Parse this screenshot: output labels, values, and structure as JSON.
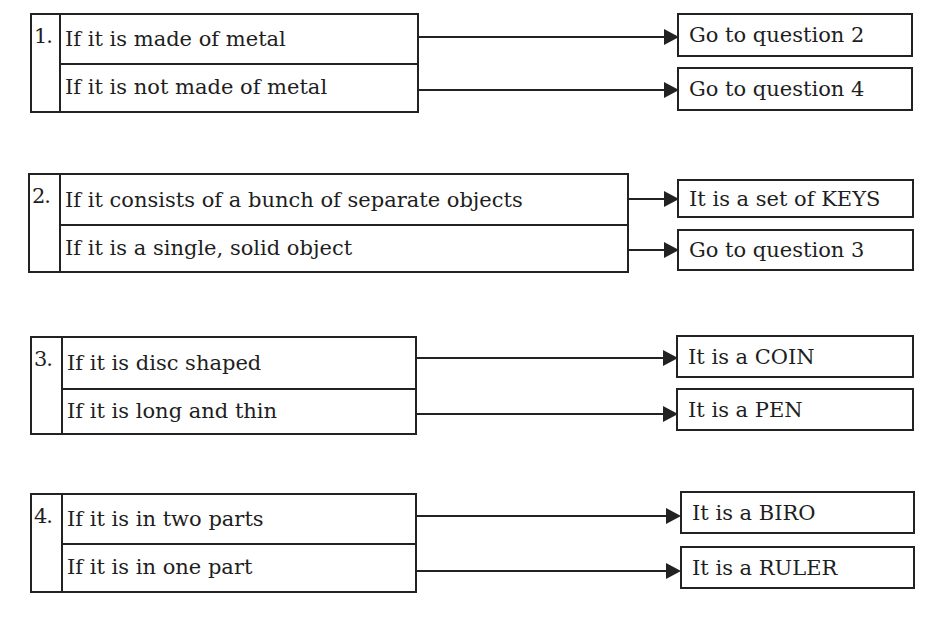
{
  "questions": [
    {
      "number": "1.",
      "options": [
        {
          "condition": "If it is made of metal",
          "result": "Go to question 2"
        },
        {
          "condition": "If it is not made of metal",
          "result": "Go to question 4"
        }
      ]
    },
    {
      "number": "2.",
      "options": [
        {
          "condition": "If it consists of a bunch of separate objects",
          "result": "It is a set of KEYS"
        },
        {
          "condition": "If it is a single, solid object",
          "result": "Go to question 3"
        }
      ]
    },
    {
      "number": "3.",
      "options": [
        {
          "condition": "If it is disc shaped",
          "result": "It is a COIN"
        },
        {
          "condition": "If it is long and thin",
          "result": "It is a PEN"
        }
      ]
    },
    {
      "number": "4.",
      "options": [
        {
          "condition": "If it is in two parts",
          "result": "It is a BIRO"
        },
        {
          "condition": "If it is in one part",
          "result": "It is a RULER"
        }
      ]
    }
  ],
  "icons": {
    "arrow": "right-arrow-icon"
  },
  "colors": {
    "line": "#222222",
    "text": "#1e1e1e",
    "background": "#ffffff"
  }
}
